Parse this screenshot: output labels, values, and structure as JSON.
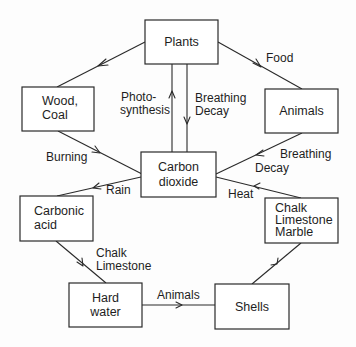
{
  "diagram": {
    "type": "cycle-flowchart",
    "nodes": [
      {
        "id": "plants",
        "lines": [
          "Plants"
        ]
      },
      {
        "id": "wood_coal",
        "lines": [
          "Wood,",
          "Coal"
        ]
      },
      {
        "id": "animals",
        "lines": [
          "Animals"
        ]
      },
      {
        "id": "carbon_dioxide",
        "lines": [
          "Carbon",
          "dioxide"
        ]
      },
      {
        "id": "carbonic_acid",
        "lines": [
          "Carbonic",
          "acid"
        ]
      },
      {
        "id": "chalk_limestone_marble",
        "lines": [
          "Chalk",
          "Limestone",
          "Marble"
        ]
      },
      {
        "id": "hard_water",
        "lines": [
          "Hard",
          "water"
        ]
      },
      {
        "id": "shells",
        "lines": [
          "Shells"
        ]
      }
    ],
    "edges": [
      {
        "from": "plants",
        "to": "wood_coal",
        "label_lines": []
      },
      {
        "from": "plants",
        "to": "animals",
        "label_lines": [
          "Food"
        ]
      },
      {
        "from": "carbon_dioxide",
        "to": "plants",
        "label_lines": [
          "Photo-",
          "synthesis"
        ]
      },
      {
        "from": "plants",
        "to": "carbon_dioxide",
        "label_lines": [
          "Breathing",
          "Decay"
        ]
      },
      {
        "from": "wood_coal",
        "to": "carbon_dioxide",
        "label_lines": [
          "Burning"
        ]
      },
      {
        "from": "animals",
        "to": "carbon_dioxide",
        "label_lines": [
          "Breathing",
          "Decay"
        ]
      },
      {
        "from": "carbon_dioxide",
        "to": "carbonic_acid",
        "label_lines": [
          "Rain"
        ]
      },
      {
        "from": "chalk_limestone_marble",
        "to": "carbon_dioxide",
        "label_lines": [
          "Heat"
        ]
      },
      {
        "from": "carbonic_acid",
        "to": "hard_water",
        "label_lines": [
          "Chalk",
          "Limestone"
        ]
      },
      {
        "from": "hard_water",
        "to": "shells",
        "label_lines": [
          "Animals"
        ]
      },
      {
        "from": "shells",
        "to": "chalk_limestone_marble",
        "label_lines": []
      }
    ]
  },
  "labels": {
    "plants": [
      "Plants"
    ],
    "wood_coal": [
      "Wood,",
      "Coal"
    ],
    "animals": [
      "Animals"
    ],
    "carbon_dioxide": [
      "Carbon",
      "dioxide"
    ],
    "carbonic_acid": [
      "Carbonic",
      "acid"
    ],
    "chalk_limestone_marble": [
      "Chalk",
      "Limestone",
      "Marble"
    ],
    "hard_water": [
      "Hard",
      "water"
    ],
    "shells": [
      "Shells"
    ],
    "edge_food": [
      "Food"
    ],
    "edge_photosynthesis": [
      "Photo-",
      "synthesis"
    ],
    "edge_breathing_decay_plants": [
      "Breathing",
      "Decay"
    ],
    "edge_burning": [
      "Burning"
    ],
    "edge_breathing_decay_animals": [
      "Breathing",
      "Decay"
    ],
    "edge_rain": [
      "Rain"
    ],
    "edge_heat": [
      "Heat"
    ],
    "edge_chalk_limestone": [
      "Chalk",
      "Limestone"
    ],
    "edge_animals": [
      "Animals"
    ]
  }
}
